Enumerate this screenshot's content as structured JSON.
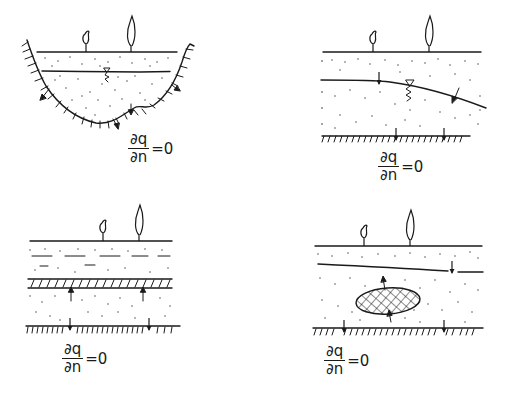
{
  "figure": {
    "panels": [
      {
        "id": "basin-aquifer",
        "caption": "Aquifer filling a basin-shaped depression with water table and flux through curved impermeable boundary",
        "plants": 2,
        "boundary_condition": {
          "numerator": "∂q",
          "denominator": "∂n",
          "rhs": "=0"
        }
      },
      {
        "id": "sloping-water-table",
        "caption": "Unconfined aquifer with sloping water table over impermeable base",
        "plants": 2,
        "boundary_condition": {
          "numerator": "∂q",
          "denominator": "∂n",
          "rhs": "=0"
        }
      },
      {
        "id": "layered-aquifer",
        "caption": "Two-layer aquifer separated by a hatched aquitard over impermeable base",
        "plants": 2,
        "boundary_condition": {
          "numerator": "∂q",
          "denominator": "∂n",
          "rhs": "=0"
        }
      },
      {
        "id": "lens-aquifer",
        "caption": "Aquifer containing a cross-hatched low-permeability lens and perched water line",
        "plants": 2,
        "boundary_condition": {
          "numerator": "∂q",
          "denominator": "∂n",
          "rhs": "=0"
        }
      }
    ],
    "colors": {
      "ink": "#1a1a1a",
      "background": "#ffffff"
    }
  }
}
